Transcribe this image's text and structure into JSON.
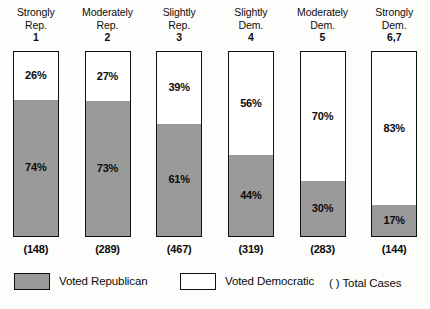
{
  "chart_data": {
    "type": "bar",
    "title": "",
    "subtitle": "",
    "xlabel": "",
    "ylabel": "",
    "ylim": [
      0,
      100
    ],
    "grid": false,
    "stacked": true,
    "orientation": "vertical",
    "legend_position": "bottom",
    "categories": [
      "Strongly Rep. 1",
      "Moderately Rep. 2",
      "Slightly Rep. 3",
      "Slightly Dem. 4",
      "Moderately Dem. 5",
      "Strongly Dem. 6,7"
    ],
    "series": [
      {
        "name": "Voted Democratic",
        "values": [
          26,
          27,
          39,
          56,
          70,
          83
        ],
        "color": "#ffffff"
      },
      {
        "name": "Voted Republican",
        "values": [
          74,
          73,
          61,
          44,
          30,
          17
        ],
        "color": "#9a9a9a"
      }
    ],
    "total_cases": [
      148,
      289,
      467,
      319,
      283,
      144
    ]
  },
  "columns": [
    {
      "header_line1": "Strongly",
      "header_line2": "Rep.",
      "header_scale": "1",
      "democratic_label": "26%",
      "republican_label": "74%",
      "democratic_pct": 26,
      "republican_pct": 74,
      "cases_label": "(148)"
    },
    {
      "header_line1": "Moderately",
      "header_line2": "Rep.",
      "header_scale": "2",
      "democratic_label": "27%",
      "republican_label": "73%",
      "democratic_pct": 27,
      "republican_pct": 73,
      "cases_label": "(289)"
    },
    {
      "header_line1": "Slightly",
      "header_line2": "Rep.",
      "header_scale": "3",
      "democratic_label": "39%",
      "republican_label": "61%",
      "democratic_pct": 39,
      "republican_pct": 61,
      "cases_label": "(467)"
    },
    {
      "header_line1": "Slightly",
      "header_line2": "Dem.",
      "header_scale": "4",
      "democratic_label": "56%",
      "republican_label": "44%",
      "democratic_pct": 56,
      "republican_pct": 44,
      "cases_label": "(319)"
    },
    {
      "header_line1": "Moderately",
      "header_line2": "Dem.",
      "header_scale": "5",
      "democratic_label": "70%",
      "republican_label": "30%",
      "democratic_pct": 70,
      "republican_pct": 30,
      "cases_label": "(283)"
    },
    {
      "header_line1": "Strongly",
      "header_line2": "Dem.",
      "header_scale": "6,7",
      "democratic_label": "83%",
      "republican_label": "17%",
      "democratic_pct": 83,
      "republican_pct": 17,
      "cases_label": "(144)"
    }
  ],
  "legend": {
    "republican_label": "Voted Republican",
    "democratic_label": "Voted Democratic",
    "cases_label": "( ) Total Cases"
  },
  "colors": {
    "republican": "#9a9a9a",
    "democratic": "#ffffff",
    "outline": "#111111",
    "text": "#0b0b0b",
    "background": "#fdfdfc"
  }
}
